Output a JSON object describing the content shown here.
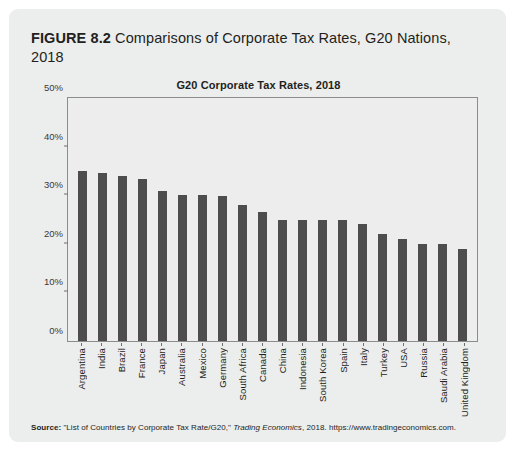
{
  "figure": {
    "label": "FIGURE 8.2",
    "caption": "Comparisons of Corporate Tax Rates, G20 Nations, 2018"
  },
  "source": {
    "label": "Source:",
    "text_before": "\"List of Countries by Corporate Tax Rate/G20,\" ",
    "italic": "Trading Economics",
    "text_after": ", 2018. https://www.tradingeconomics.com."
  },
  "colors": {
    "panel_background": "#eceded",
    "plot_background": "#ededee",
    "bar": "#4d4d4d",
    "axis": "#8c8c8c",
    "text": "#231f20"
  },
  "chart_data": {
    "type": "bar",
    "title": "G20 Corporate Tax Rates, 2018",
    "xlabel": "",
    "ylabel": "",
    "ylim": [
      0,
      50
    ],
    "yticks": [
      0,
      10,
      20,
      30,
      40,
      50
    ],
    "ytick_labels": [
      "0%",
      "10%",
      "20%",
      "30%",
      "40%",
      "50%"
    ],
    "grid": false,
    "legend": null,
    "categories": [
      "Argentina",
      "India",
      "Brazil",
      "France",
      "Japan",
      "Australia",
      "Mexico",
      "Germany",
      "South Africa",
      "Canada",
      "China",
      "Indonesia",
      "South Korea",
      "Spain",
      "Italy",
      "Turkey",
      "USA",
      "Russia",
      "Saudi Arabia",
      "United Kingdom"
    ],
    "values": [
      35,
      34.6,
      34,
      33.3,
      30.9,
      30,
      30,
      29.8,
      28,
      26.5,
      25,
      25,
      25,
      25,
      24,
      22,
      21,
      20,
      20,
      19
    ]
  }
}
